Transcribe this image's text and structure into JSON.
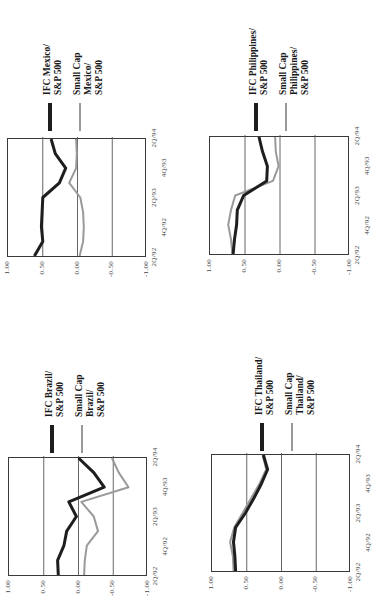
{
  "chart_data": [
    {
      "type": "line",
      "title": "IFC Brazil vs Small Cap Brazil relative to S&P 500",
      "xlabel": "",
      "ylabel": "",
      "ylim": [
        -1.0,
        1.0
      ],
      "y_ticks": [
        "1.00",
        "0.50",
        "0.00",
        "-0.50",
        "-1.00"
      ],
      "x": [
        "2Q/92",
        "3Q/92",
        "4Q/92",
        "1Q/93",
        "2Q/93",
        "3Q/93",
        "4Q/93",
        "1Q/94",
        "2Q/94"
      ],
      "x_tick_labels_row1": [
        "2Q/92",
        "2Q/93",
        "2Q/94"
      ],
      "x_tick_labels_row2": [
        "4Q/92",
        "4Q/93"
      ],
      "grid": "horizontal at 0.50, 0.00, -0.50",
      "legend_position": "right",
      "series": [
        {
          "name": "IFC Brazil/ S&P 500",
          "style": "thick-black",
          "values": [
            0.29,
            0.3,
            0.21,
            0.17,
            0.03,
            0.14,
            -0.37,
            -0.22,
            0.0
          ]
        },
        {
          "name": "Small Cap Brazil/ S&P 500",
          "style": "thin-gray",
          "values": [
            -0.08,
            -0.09,
            -0.12,
            -0.28,
            -0.22,
            -0.04,
            -0.72,
            -0.58,
            -0.48
          ]
        }
      ]
    },
    {
      "type": "line",
      "title": "IFC Mexico vs Small Cap Mexico relative to S&P 500",
      "xlabel": "",
      "ylabel": "",
      "ylim": [
        -1.0,
        1.0
      ],
      "y_ticks": [
        "1.00",
        "0.50",
        "0.00",
        "-0.50",
        "-1.00"
      ],
      "x": [
        "2Q/92",
        "3Q/92",
        "4Q/92",
        "1Q/93",
        "2Q/93",
        "3Q/93",
        "4Q/93",
        "1Q/94",
        "2Q/94"
      ],
      "x_tick_labels_row1": [
        "2Q/92",
        "2Q/93",
        "2Q/94"
      ],
      "x_tick_labels_row2": [
        "4Q/92",
        "4Q/93"
      ],
      "grid": "horizontal at 0.50, 0.00, -0.50",
      "legend_position": "right",
      "series": [
        {
          "name": "IFC Mexico/ S&P 500",
          "style": "thick-black",
          "values": [
            0.62,
            0.5,
            0.52,
            0.51,
            0.5,
            0.26,
            0.17,
            0.32,
            0.38
          ]
        },
        {
          "name": "Small Cap Mexico/ S&P 500",
          "style": "thin-gray",
          "values": [
            -0.03,
            -0.08,
            -0.09,
            -0.08,
            -0.04,
            0.12,
            0.02,
            0.01,
            0.02
          ]
        }
      ]
    },
    {
      "type": "line",
      "title": "IFC Thailand vs Small Cap Thailand relative to S&P 500",
      "xlabel": "",
      "ylabel": "",
      "ylim": [
        -1.0,
        1.0
      ],
      "y_ticks": [
        "1.00",
        "0.50",
        "0.00",
        "-0.50",
        "-1.00"
      ],
      "x": [
        "2Q/92",
        "3Q/92",
        "4Q/92",
        "1Q/93",
        "2Q/93",
        "3Q/93",
        "4Q/93",
        "1Q/94",
        "2Q/94"
      ],
      "x_tick_labels_row1": [
        "2Q/92",
        "2Q/93",
        "2Q/94"
      ],
      "x_tick_labels_row2": [
        "4Q/92",
        "4Q/93"
      ],
      "grid": "horizontal at 0.50, 0.00, -0.50",
      "legend_position": "right",
      "series": [
        {
          "name": "IFC Thailand/ S&P 500",
          "style": "thick-black",
          "values": [
            0.66,
            0.67,
            0.69,
            0.66,
            0.52,
            0.4,
            0.29,
            0.2,
            0.26
          ]
        },
        {
          "name": "Small Cap Thailand/ S&P 500",
          "style": "thin-gray",
          "values": [
            0.69,
            0.7,
            0.74,
            0.68,
            0.56,
            0.44,
            0.32,
            0.22,
            0.27
          ]
        }
      ]
    },
    {
      "type": "line",
      "title": "IFC Philippines vs Small Cap Philippines relative to S&P 500",
      "xlabel": "",
      "ylabel": "",
      "ylim": [
        -1.0,
        1.0
      ],
      "y_ticks": [
        "1.00",
        "0.50",
        "0.00",
        "-0.50",
        "-1.00"
      ],
      "x": [
        "2Q/92",
        "3Q/92",
        "4Q/92",
        "1Q/93",
        "2Q/93",
        "3Q/93",
        "4Q/93",
        "1Q/94",
        "2Q/94"
      ],
      "x_tick_labels_row1": [
        "2Q/92",
        "2Q/93",
        "2Q/94"
      ],
      "x_tick_labels_row2": [
        "4Q/92",
        "4Q/93"
      ],
      "grid": "horizontal at 0.50, 0.00, -0.50",
      "legend_position": "right",
      "series": [
        {
          "name": "IFC Philippines/ S&P 500",
          "style": "thick-black",
          "values": [
            0.67,
            0.65,
            0.62,
            0.61,
            0.52,
            0.19,
            0.18,
            0.25,
            0.3
          ]
        },
        {
          "name": "Small Cap Philippines/ S&P 500",
          "style": "thin-gray",
          "values": [
            0.68,
            0.7,
            0.74,
            0.7,
            0.64,
            0.1,
            0.02,
            0.06,
            0.07
          ]
        }
      ]
    }
  ],
  "panels": [
    {
      "id": "brazil",
      "legend": {
        "ifc": [
          "IFC Brazil/",
          "S&P 500"
        ],
        "small_cap": [
          "Small Cap",
          "Brazil/",
          "S&P 500"
        ]
      }
    },
    {
      "id": "mexico",
      "legend": {
        "ifc": [
          "IFC Mexico/",
          "S&P 500"
        ],
        "small_cap": [
          "Small Cap",
          "Mexico/",
          "S&P 500"
        ]
      }
    },
    {
      "id": "thailand",
      "legend": {
        "ifc": [
          "IFC Thailand/",
          "S&P 500"
        ],
        "small_cap": [
          "Small Cap",
          "Thailand/",
          "S&P 500"
        ]
      }
    },
    {
      "id": "philippines",
      "legend": {
        "ifc": [
          "IFC Philippines/",
          "S&P 500"
        ],
        "small_cap": [
          "Small Cap",
          "Philippines/",
          "S&P 500"
        ]
      }
    }
  ],
  "colors": {
    "ifc_line": "#1e1e1e",
    "small_cap_line": "#9a9a9a",
    "frame": "#3a3a3a",
    "gridline": "#555555"
  }
}
